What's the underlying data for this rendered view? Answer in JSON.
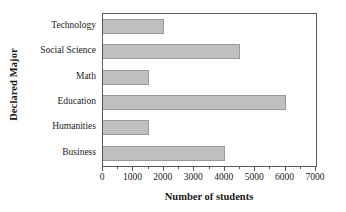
{
  "chart_data": {
    "type": "bar",
    "orientation": "horizontal",
    "title": "",
    "xlabel": "Number of students",
    "ylabel": "Declared Major",
    "categories": [
      "Technology",
      "Social Science",
      "Math",
      "Education",
      "Humanities",
      "Business"
    ],
    "values": [
      2000,
      4500,
      1500,
      6000,
      1500,
      4000
    ],
    "xlim": [
      0,
      7000
    ],
    "xticks": [
      0,
      1000,
      2000,
      3000,
      4000,
      5000,
      6000,
      7000
    ],
    "xticklabels": [
      "0",
      "1000",
      "2000",
      "3000",
      "4000",
      "5000",
      "6000",
      "7000"
    ],
    "minor_tick_step": 500,
    "grid": false,
    "legend": false,
    "bar_color": "#bfbfbf",
    "bar_edge_color": "#9a9a9a",
    "frame_color": "#5a5a5a"
  }
}
